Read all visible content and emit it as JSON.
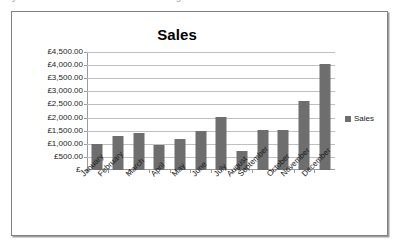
{
  "top_strip": {
    "ghost_left": "y",
    "ghost_right": "g"
  },
  "chart_data": {
    "type": "bar",
    "title": "Sales",
    "xlabel": "",
    "ylabel": "",
    "categories": [
      "January",
      "February",
      "March",
      "April",
      "May",
      "June",
      "July",
      "August",
      "September",
      "October",
      "November",
      "December"
    ],
    "series": [
      {
        "name": "Sales",
        "color": "#6e6e6e",
        "values": [
          1000,
          1300,
          1400,
          960,
          1200,
          1480,
          2030,
          720,
          1520,
          1520,
          2620,
          4030
        ]
      }
    ],
    "ylim": [
      0,
      4500
    ],
    "ytick_values": [
      4500,
      4000,
      3500,
      3000,
      2500,
      2000,
      1500,
      1000,
      500,
      0
    ],
    "ytick_labels": [
      "£4,500.00",
      "£4,000.00",
      "£3,500.00",
      "£3,000.00",
      "£2,500.00",
      "£2,000.00",
      "£1,500.00",
      "£1,000.00",
      "£500.00",
      "£-"
    ],
    "grid": true,
    "legend": {
      "position": "right",
      "entries": [
        "Sales"
      ]
    },
    "currency_symbol": "£"
  }
}
